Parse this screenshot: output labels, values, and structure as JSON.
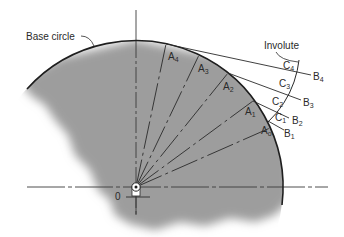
{
  "diagram": {
    "labels": {
      "base_circle": "Base circle",
      "involute": "Involute",
      "origin": "0"
    },
    "colors": {
      "fill": "#9d9d9d",
      "line": "#2a2a2a",
      "background": "#ffffff"
    },
    "points_A": [
      {
        "id": "Ao",
        "base": "A",
        "sub": "o"
      },
      {
        "id": "A1",
        "base": "A",
        "sub": "1"
      },
      {
        "id": "A2",
        "base": "A",
        "sub": "2"
      },
      {
        "id": "A3",
        "base": "A",
        "sub": "3"
      },
      {
        "id": "A4",
        "base": "A",
        "sub": "4"
      }
    ],
    "points_B": [
      {
        "id": "B1",
        "base": "B",
        "sub": "1"
      },
      {
        "id": "B2",
        "base": "B",
        "sub": "2"
      },
      {
        "id": "B3",
        "base": "B",
        "sub": "3"
      },
      {
        "id": "B4",
        "base": "B",
        "sub": "4"
      }
    ],
    "points_C": [
      {
        "id": "C1",
        "base": "C",
        "sub": "1"
      },
      {
        "id": "C2",
        "base": "C",
        "sub": "2"
      },
      {
        "id": "C3",
        "base": "C",
        "sub": "3"
      },
      {
        "id": "C4",
        "base": "C",
        "sub": "4"
      }
    ]
  }
}
